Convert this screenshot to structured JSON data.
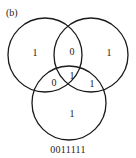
{
  "panel_label": "(b)",
  "caption": "0011111",
  "regions": {
    "a_only": "1",
    "ab_only": "0",
    "b_only": "1",
    "ac_only": "0",
    "abc": "1",
    "bc_only": "1",
    "c_only": "1"
  },
  "colors": {
    "stroke": "#1a1a1a",
    "background": "#ffffff"
  }
}
